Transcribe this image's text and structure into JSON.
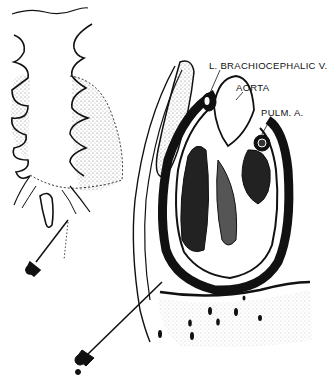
{
  "figure": {
    "colors": {
      "ink": "#111111",
      "paper": "#ffffff",
      "stipple": "#888888"
    },
    "labels": {
      "brachiocephalic": "L. BRACHIOCEPHALIC V.",
      "aorta": "AORTA",
      "pulm": "PULM. A."
    },
    "panels": [
      {
        "name": "anterior-chest-view",
        "description": "Sternum and ribs with dotted heart outline and needle entering subxiphoid"
      },
      {
        "name": "sagittal-section",
        "description": "Heart within pericardial sac, needle inserted below sternum into pericardial space"
      }
    ]
  }
}
